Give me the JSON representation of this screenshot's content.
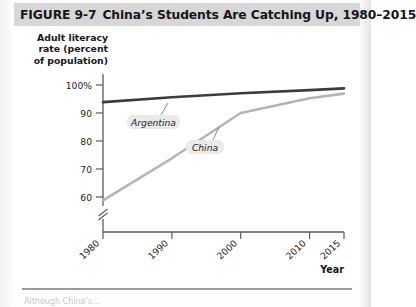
{
  "figure": {
    "number": "FIGURE  9-7",
    "title": "China’s Students Are Catching Up, 1980–2015",
    "caption_partial": "Although China’s…"
  },
  "chart_data": {
    "type": "line",
    "title": "China’s Students Are Catching Up, 1980–2015",
    "xlabel": "Year",
    "ylabel": "Adult literacy rate (percent of population)",
    "x": [
      1980,
      1990,
      2000,
      2010,
      2015
    ],
    "xlim": [
      1980,
      2015
    ],
    "ylim": [
      57,
      102
    ],
    "yticks": [
      "100%",
      "90",
      "80",
      "70",
      "60"
    ],
    "ytick_values": [
      100,
      90,
      80,
      70,
      60
    ],
    "xticks": [
      "1980",
      "1990",
      "2000",
      "2010",
      "2015"
    ],
    "grid": false,
    "axis_break": true,
    "legend": "inline-labels",
    "series": [
      {
        "name": "Argentina",
        "color": "#3b3b40",
        "values": [
          94.0,
          95.4,
          96.5,
          97.4,
          97.9
        ]
      },
      {
        "name": "China",
        "color": "#b4b4b4",
        "values": [
          66.0,
          78.0,
          90.9,
          95.1,
          96.4
        ]
      }
    ]
  },
  "axis": {
    "y_title_line1": "Adult literacy",
    "y_title_line2": "rate (percent",
    "y_title_line3": "of population)",
    "x_title": "Year"
  },
  "ticks": {
    "y": [
      "100%",
      "90",
      "80",
      "70",
      "60"
    ],
    "x": [
      "1980",
      "1990",
      "2000",
      "2010",
      "2015"
    ]
  },
  "series_labels": {
    "argentina": "Argentina",
    "china": "China"
  },
  "colors": {
    "title_bar": "#d7d7d7",
    "argentina_line": "#3b3b40",
    "china_line": "#b4b4b4",
    "axis": "#5a5a5a",
    "label_bg": "#eaeaea"
  }
}
